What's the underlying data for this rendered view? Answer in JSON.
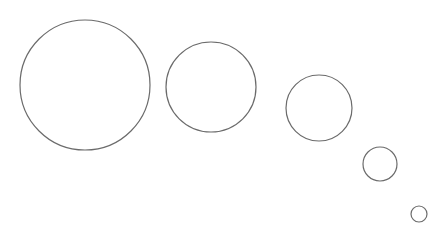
{
  "canvas": {
    "width": 435,
    "height": 230,
    "background": "#ffffff"
  },
  "style": {
    "stroke": "#6b6b6b",
    "stroke_width": 1.2,
    "fill": "none"
  },
  "circles": [
    {
      "id": "circle-1",
      "cx": 85,
      "cy": 85,
      "r": 65
    },
    {
      "id": "circle-2",
      "cx": 211,
      "cy": 87,
      "r": 45
    },
    {
      "id": "circle-3",
      "cx": 319,
      "cy": 108,
      "r": 33
    },
    {
      "id": "circle-4",
      "cx": 380,
      "cy": 164,
      "r": 17
    },
    {
      "id": "circle-5",
      "cx": 419,
      "cy": 214,
      "r": 8
    }
  ]
}
